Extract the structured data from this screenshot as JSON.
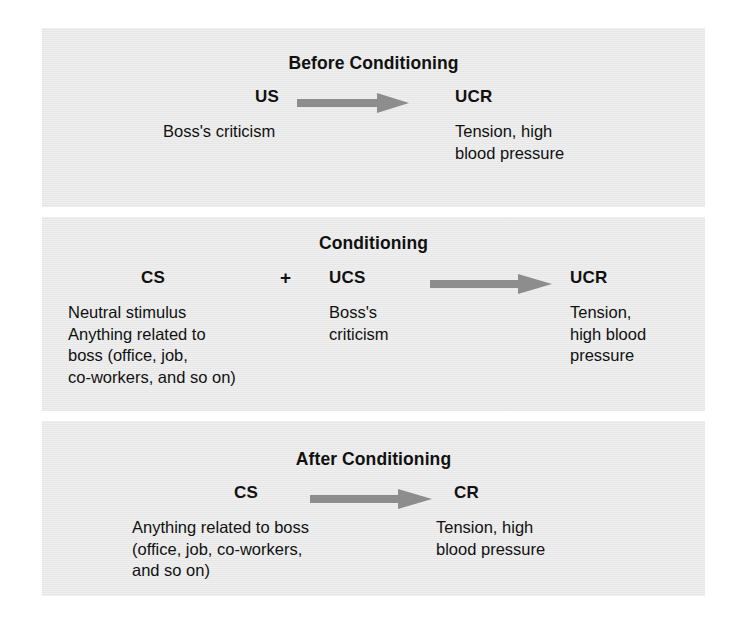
{
  "figure": {
    "kind": "classical-conditioning-diagram",
    "background_color": "#ffffff",
    "panel_color": "#e9e9e9",
    "text_color": "#111111",
    "arrow_color": "#808080"
  },
  "panels": [
    {
      "id": "before",
      "title": "Before Conditioning",
      "stimulus_term": "US",
      "stimulus_text": "Boss's criticism",
      "response_term": "UCR",
      "response_text": "Tension, high\nblood pressure",
      "arrow": "right-arrow-icon"
    },
    {
      "id": "conditioning",
      "title": "Conditioning",
      "stimulus_term": "CS",
      "stimulus_text": "Neutral stimulus\nAnything related to\nboss (office, job,\nco-workers,  and so on)",
      "plus_sign": "+",
      "second_term": "UCS",
      "second_text": "Boss's\ncriticism",
      "response_term": "UCR",
      "response_text": "Tension,\nhigh blood\npressure",
      "arrow": "right-arrow-icon"
    },
    {
      "id": "after",
      "title": "After Conditioning",
      "stimulus_term": "CS",
      "stimulus_text": "Anything related to boss\n(office, job, co-workers,\nand so on)",
      "response_term": "CR",
      "response_text": "Tension, high\nblood pressure",
      "arrow": "right-arrow-icon"
    }
  ]
}
